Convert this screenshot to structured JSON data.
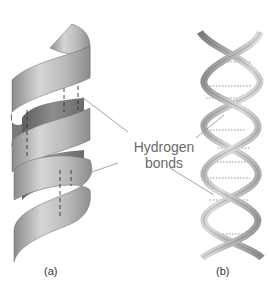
{
  "figure": {
    "annotation": {
      "line1": "Hydrogen",
      "line2": "bonds"
    },
    "panels": [
      {
        "id": "a",
        "label": "(a)",
        "description": "alpha helix ribbon"
      },
      {
        "id": "b",
        "label": "(b)",
        "description": "double helix ribbon"
      }
    ],
    "colors": {
      "ribbon_light": "#d8d8d8",
      "ribbon_mid": "#a8a8a8",
      "ribbon_dark": "#6e6e6e",
      "leader_line": "#9a9a9a",
      "dashed_bond": "#333333",
      "dotted_bond": "#777777",
      "label_text": "#6a6a6a"
    }
  }
}
